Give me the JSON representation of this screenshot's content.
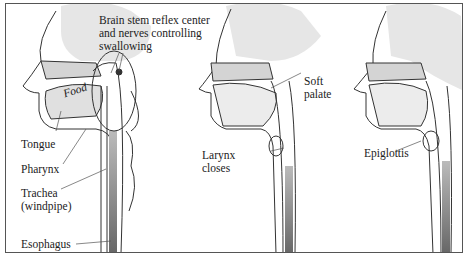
{
  "figure": {
    "panels": [
      {
        "id": "panel-1",
        "labels": {
          "brain_stem": [
            "Brain stem reflex center",
            "and nerves controlling",
            "swallowing"
          ],
          "food": "Food",
          "tongue": "Tongue",
          "pharynx": "Pharynx",
          "trachea": [
            "Trachea",
            "(windpipe)"
          ],
          "esophagus": "Esophagus"
        }
      },
      {
        "id": "panel-2",
        "labels": {
          "soft_palate": [
            "Soft",
            "palate"
          ],
          "larynx": [
            "Larynx",
            "closes"
          ]
        }
      },
      {
        "id": "panel-3",
        "labels": {
          "epiglottis": "Epiglottis"
        }
      }
    ],
    "colors": {
      "brain": "#e6e6e6",
      "tissue": "#d4d4d4",
      "esophagus": "#8a8a8a",
      "line": "#333333"
    }
  }
}
